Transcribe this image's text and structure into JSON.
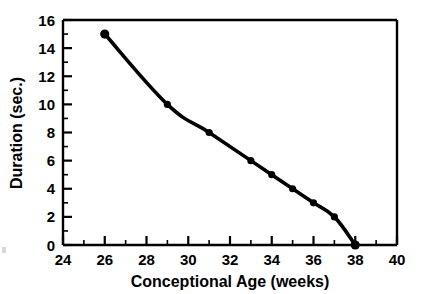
{
  "chart_data": {
    "type": "line",
    "title": "",
    "subtitle": "",
    "xlabel": "Conceptional Age (weeks)",
    "ylabel": "Duration (sec.)",
    "xlim": [
      24,
      40
    ],
    "ylim": [
      0,
      16
    ],
    "xticks": [
      24,
      26,
      28,
      30,
      32,
      34,
      36,
      38,
      40
    ],
    "yticks": [
      0,
      2,
      4,
      6,
      8,
      10,
      12,
      14,
      16
    ],
    "xtick_labels": [
      "24",
      "26",
      "28",
      "30",
      "32",
      "34",
      "36",
      "38",
      "40"
    ],
    "ytick_labels": [
      "0",
      "2",
      "4",
      "6",
      "8",
      "10",
      "12",
      "14",
      "16"
    ],
    "x_minor_tick_interval": 1,
    "y_minor_tick_interval": 1,
    "grid": false,
    "legend": false,
    "legend_position": "none",
    "line_color": "#000000",
    "marker_color": "#000000",
    "marker_shape": "circle",
    "frame_color": "#000000",
    "background_color": "#ffffff",
    "x": [
      26,
      29,
      31,
      33,
      34,
      35,
      36,
      37,
      38
    ],
    "y": [
      15,
      10,
      8,
      6,
      5,
      4,
      3,
      2,
      0
    ],
    "series": [
      {
        "name": "Duration",
        "points": [
          {
            "x": 26,
            "y": 15
          },
          {
            "x": 29,
            "y": 10
          },
          {
            "x": 31,
            "y": 8
          },
          {
            "x": 33,
            "y": 6
          },
          {
            "x": 34,
            "y": 5
          },
          {
            "x": 35,
            "y": 4
          },
          {
            "x": 36,
            "y": 3
          },
          {
            "x": 37,
            "y": 2
          },
          {
            "x": 38,
            "y": 0
          }
        ]
      }
    ],
    "annotations": []
  }
}
